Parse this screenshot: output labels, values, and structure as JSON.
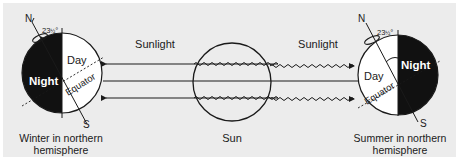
{
  "diagram": {
    "type": "seasons-earth-orbit",
    "colors": {
      "background": "#ececec",
      "night_fill": "#111111",
      "day_fill": "#ffffff",
      "stroke": "#1a1a1a"
    },
    "sun": {
      "label": "Sun"
    },
    "sunlight": {
      "left_label": "Sunlight",
      "right_label": "Sunlight"
    },
    "left_earth": {
      "north": "N",
      "south": "S",
      "tilt": "23½°",
      "tilt_whole": "23",
      "tilt_frac": "½",
      "tilt_deg": "°",
      "day": "Day",
      "night": "Night",
      "equator": "Equator",
      "caption_line1": "Winter in northern",
      "caption_line2": "hemisphere"
    },
    "right_earth": {
      "north": "N",
      "south": "S",
      "tilt": "23½°",
      "tilt_whole": "23",
      "tilt_frac": "½",
      "tilt_deg": "°",
      "day": "Day",
      "night": "Night",
      "equator": "Equator",
      "caption_line1": "Summer in northern",
      "caption_line2": "hemisphere"
    }
  }
}
